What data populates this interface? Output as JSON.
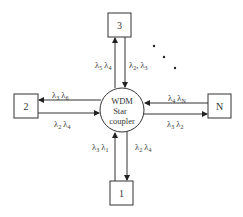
{
  "diagram": {
    "hub": {
      "lines": [
        "WDM",
        "Star",
        "coupler"
      ]
    },
    "nodes": [
      {
        "id": "3",
        "label": "3",
        "position": "top"
      },
      {
        "id": "2",
        "label": "2",
        "position": "left"
      },
      {
        "id": "N",
        "label": "N",
        "position": "right"
      },
      {
        "id": "1",
        "label": "1",
        "position": "bottom"
      }
    ],
    "links": {
      "top_up": {
        "sym": "λ",
        "subs": [
          "5",
          "4"
        ],
        "direction": "to node 3"
      },
      "top_down": {
        "sym": "λ",
        "subs": [
          "2",
          "3"
        ],
        "direction": "from node 3",
        "separator": ","
      },
      "left_to_node": {
        "sym": "λ",
        "subs": [
          "3",
          "6"
        ],
        "direction": "to node 2"
      },
      "left_from_node": {
        "sym": "λ",
        "subs": [
          "2",
          "4"
        ],
        "direction": "from node 2"
      },
      "right_from_node": {
        "sym": "λ",
        "subs": [
          "4",
          "N"
        ],
        "direction": "from node N"
      },
      "right_to_node": {
        "sym": "λ",
        "subs": [
          "3",
          "2"
        ],
        "direction": "to node N"
      },
      "bottom_up": {
        "sym": "λ",
        "subs": [
          "3",
          "1"
        ],
        "direction": "from node 1"
      },
      "bottom_down": {
        "sym": "λ",
        "subs": [
          "2",
          "4"
        ],
        "direction": "to node 1"
      }
    },
    "ellipsis_dots": 3,
    "colors": {
      "stroke": "#333333",
      "background": "#ffffff"
    }
  }
}
